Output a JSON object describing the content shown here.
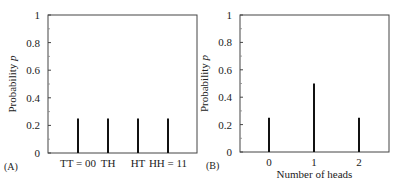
{
  "chart_data": [
    {
      "type": "bar",
      "panel_label": "(A)",
      "categories": [
        "TT = 00",
        "TH",
        "HT",
        "HH = 11"
      ],
      "values": [
        0.25,
        0.25,
        0.25,
        0.25
      ],
      "xlabel": "",
      "ylabel": "Probability p",
      "ylim": [
        0,
        1
      ],
      "yticks": [
        "0",
        "0.2",
        "0.4",
        "0.6",
        "0.8",
        "1"
      ],
      "grid": false,
      "legend": null
    },
    {
      "type": "bar",
      "panel_label": "(B)",
      "categories": [
        "0",
        "1",
        "2"
      ],
      "values": [
        0.25,
        0.5,
        0.25
      ],
      "xlabel": "Number of heads",
      "ylabel": "Probability p",
      "ylim": [
        0,
        1
      ],
      "yticks": [
        "0",
        "0.2",
        "0.4",
        "0.6",
        "0.8",
        "1"
      ],
      "grid": false,
      "legend": null
    }
  ]
}
